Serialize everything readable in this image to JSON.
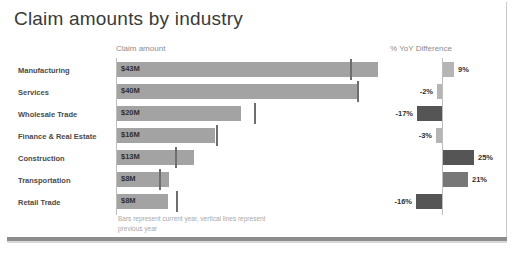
{
  "title": "Claim amounts by industry",
  "panels": {
    "left_header": "Claim amount",
    "right_header": "% YoY Difference"
  },
  "footnote_line1": "Bars represent current year, vertical lines",
  "footnote_line2": "represent previous year",
  "colors": {
    "bar_gray": "#a3a3a3",
    "bar_dark": "#555555",
    "bar_mid": "#777777",
    "bar_light": "#b5b5b5",
    "axis": "#bdbdbd",
    "marker": "#6e6e6e",
    "title_text": "#3a3a3a",
    "label_text": "#4a4a4a",
    "header_text": "#8c8c8c",
    "footnote_text": "#a8a8a8",
    "frame_bottom": "#8d8d8d"
  },
  "chart_data": {
    "type": "bar",
    "title": "Claim amounts by industry",
    "categories": [
      "Manufacturing",
      "Services",
      "Wholesale Trade",
      "Finance & Real Estate",
      "Construction",
      "Transportation",
      "Retail Trade"
    ],
    "panels": [
      {
        "name": "Claim amount",
        "xlabel": "Claim amount",
        "unit": "$M",
        "orientation": "horizontal",
        "grid": false,
        "xlim": [
          0,
          46
        ],
        "series": [
          {
            "name": "Current year",
            "style": "bar",
            "color": "#a3a3a3",
            "values": [
              43,
              40,
              20,
              16,
              13,
              8,
              8
            ],
            "labels": [
              "$43M",
              "$40M",
              "$20M",
              "$16M",
              "$13M",
              "$8M",
              "$8M"
            ]
          },
          {
            "name": "Previous year",
            "style": "vertical-line-marker",
            "color": "#6e6e6e",
            "values": [
              39.5,
              41,
              23.5,
              16.3,
              10.2,
              7.2,
              10
            ]
          }
        ]
      },
      {
        "name": "% YoY Difference",
        "xlabel": "% YoY Difference",
        "unit": "%",
        "orientation": "horizontal-diverging",
        "grid": false,
        "xlim": [
          -20,
          28
        ],
        "zero_axis": true,
        "series": [
          {
            "name": "YoY difference",
            "style": "bar",
            "values": [
              9,
              -2,
              -17,
              -3,
              25,
              21,
              -16
            ],
            "labels": [
              "9%",
              "-2%",
              "-17%",
              "-3%",
              "25%",
              "21%",
              "-16%"
            ],
            "colors": [
              "#b5b5b5",
              "#b5b5b5",
              "#555555",
              "#b5b5b5",
              "#555555",
              "#777777",
              "#555555"
            ]
          }
        ]
      }
    ],
    "annotation": "Bars represent current year, vertical lines represent previous year"
  },
  "rows": [
    {
      "category": "Manufacturing",
      "amount_label": "$43M",
      "amount_value": 43,
      "bar_width_px": 261,
      "marker_offset_px": 234,
      "yoy_label": "9%",
      "yoy_value": 9,
      "yoy_dir": "right",
      "yoy_width_px": 11,
      "yoy_color": "#b5b5b5"
    },
    {
      "category": "Services",
      "amount_label": "$40M",
      "amount_value": 40,
      "bar_width_px": 242,
      "marker_offset_px": 241,
      "yoy_label": "-2%",
      "yoy_value": -2,
      "yoy_dir": "left",
      "yoy_width_px": 5,
      "yoy_color": "#b5b5b5"
    },
    {
      "category": "Wholesale Trade",
      "amount_label": "$20M",
      "amount_value": 20,
      "bar_width_px": 124,
      "marker_offset_px": 138,
      "yoy_label": "-17%",
      "yoy_value": -17,
      "yoy_dir": "left",
      "yoy_width_px": 25,
      "yoy_color": "#555555"
    },
    {
      "category": "Finance & Real Estate",
      "amount_label": "$16M",
      "amount_value": 16,
      "bar_width_px": 98,
      "marker_offset_px": 100,
      "yoy_label": "-3%",
      "yoy_value": -3,
      "yoy_dir": "left",
      "yoy_width_px": 6,
      "yoy_color": "#b5b5b5"
    },
    {
      "category": "Construction",
      "amount_label": "$13M",
      "amount_value": 13,
      "bar_width_px": 77,
      "marker_offset_px": 59,
      "yoy_label": "25%",
      "yoy_value": 25,
      "yoy_dir": "right",
      "yoy_width_px": 31,
      "yoy_color": "#555555"
    },
    {
      "category": "Transportation",
      "amount_label": "$8M",
      "amount_value": 8,
      "bar_width_px": 52,
      "marker_offset_px": 43,
      "yoy_label": "21%",
      "yoy_value": 21,
      "yoy_dir": "right",
      "yoy_width_px": 25,
      "yoy_color": "#777777"
    },
    {
      "category": "Retail Trade",
      "amount_label": "$8M",
      "amount_value": 8,
      "bar_width_px": 51,
      "marker_offset_px": 60,
      "yoy_label": "-16%",
      "yoy_value": -16,
      "yoy_dir": "left",
      "yoy_width_px": 26,
      "yoy_color": "#555555"
    }
  ]
}
